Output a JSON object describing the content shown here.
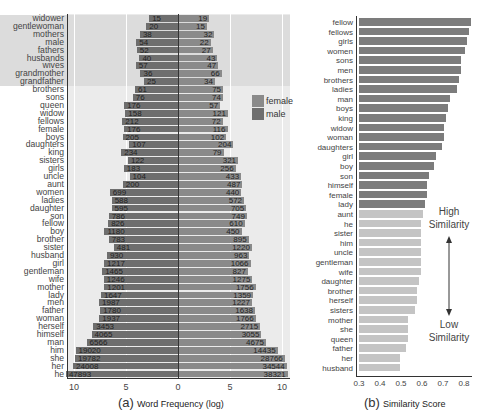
{
  "chart_data": [
    {
      "type": "bar",
      "orientation": "horizontal-diverging",
      "title": "",
      "panel_label": "(a)",
      "xlabel": "Word Frequency (log)",
      "ylabel": "",
      "x_ticks_left": [
        "10",
        "5",
        "0"
      ],
      "x_ticks_right": [
        "5",
        "10"
      ],
      "xlim": [
        -11,
        11
      ],
      "legend": [
        {
          "name": "female",
          "color": "#8a8a8a"
        },
        {
          "name": "male",
          "color": "#6e6e6e"
        }
      ],
      "legend_position": "right-inside",
      "grid": true,
      "categories": [
        "widower",
        "gentlewoman",
        "mothers",
        "male",
        "fathers",
        "husbands",
        "wives",
        "grandmother",
        "grandfather",
        "brothers",
        "sons",
        "queen",
        "widow",
        "fellows",
        "female",
        "boys",
        "daughters",
        "king",
        "sisters",
        "girls",
        "uncle",
        "aunt",
        "women",
        "ladies",
        "daughter",
        "son",
        "fellow",
        "boy",
        "brother",
        "sister",
        "husband",
        "girl",
        "gentleman",
        "wife",
        "mother",
        "lady",
        "men",
        "father",
        "woman",
        "herself",
        "himself",
        "man",
        "him",
        "she",
        "her",
        "he"
      ],
      "series": [
        {
          "name": "left",
          "values": [
            15,
            20,
            38,
            54,
            52,
            40,
            57,
            36,
            25,
            61,
            76,
            176,
            158,
            212,
            176,
            205,
            107,
            234,
            122,
            183,
            104,
            200,
            699,
            588,
            595,
            786,
            826,
            1180,
            783,
            481,
            930,
            1217,
            1465,
            1246,
            1201,
            1647,
            1987,
            1780,
            1937,
            3453,
            4065,
            6566,
            19020,
            19782,
            24008,
            47893
          ]
        },
        {
          "name": "right",
          "values": [
            19,
            15,
            32,
            22,
            27,
            43,
            47,
            66,
            34,
            75,
            74,
            57,
            121,
            72,
            116,
            102,
            204,
            79,
            321,
            256,
            433,
            487,
            440,
            572,
            705,
            749,
            610,
            450,
            895,
            1220,
            963,
            1066,
            827,
            1275,
            1756,
            1359,
            1227,
            1638,
            1766,
            2715,
            3055,
            4675,
            14435,
            28766,
            34544,
            38321
          ]
        }
      ],
      "shaded_rows_top": 9
    },
    {
      "type": "bar",
      "orientation": "horizontal",
      "title": "",
      "panel_label": "(b)",
      "xlabel": "Similarity Score",
      "ylabel": "",
      "x_ticks": [
        "0.3",
        "0.4",
        "0.5",
        "0.6",
        "0.7",
        "0.8"
      ],
      "xlim": [
        0.3,
        0.83
      ],
      "grid": false,
      "categories": [
        "fellow",
        "fellows",
        "girls",
        "women",
        "sons",
        "men",
        "brothers",
        "ladies",
        "man",
        "boys",
        "king",
        "widow",
        "woman",
        "daughters",
        "girl",
        "boy",
        "son",
        "himself",
        "female",
        "lady",
        "aunt",
        "he",
        "sister",
        "him",
        "uncle",
        "gentleman",
        "wife",
        "daughter",
        "brother",
        "herself",
        "sisters",
        "mother",
        "she",
        "queen",
        "father",
        "her",
        "husband"
      ],
      "values": [
        0.73,
        0.72,
        0.71,
        0.7,
        0.68,
        0.68,
        0.67,
        0.66,
        0.63,
        0.62,
        0.61,
        0.6,
        0.6,
        0.59,
        0.56,
        0.55,
        0.53,
        0.52,
        0.52,
        0.51,
        0.5,
        0.49,
        0.49,
        0.49,
        0.49,
        0.49,
        0.49,
        0.48,
        0.47,
        0.47,
        0.46,
        0.43,
        0.43,
        0.43,
        0.42,
        0.39,
        0.39
      ],
      "high_similarity_count": 20,
      "annotations": [
        {
          "text": "High Similarity"
        },
        {
          "text": "Low Similarity"
        }
      ]
    }
  ],
  "left": {
    "panel_letter": "(a)",
    "xlabel": "Word Frequency (log)",
    "legend": {
      "female": "female",
      "male": "male"
    }
  },
  "right": {
    "panel_letter": "(b)",
    "xlabel": "Similarity Score",
    "ann_high": "High\nSimilarity",
    "ann_low": "Low\nSimilarity"
  },
  "colors": {
    "plot_bg": "#ebebeb",
    "shaded_row_bg": "#dcdcdc",
    "female_bar": "#8a8a8a",
    "male_bar": "#6e6e6e",
    "high_sim_bar": "#7c7c7c",
    "low_sim_bar": "#c4c4c4"
  }
}
